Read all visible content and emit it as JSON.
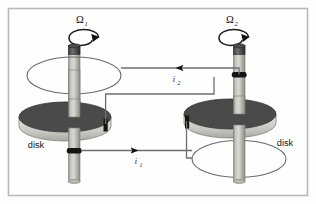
{
  "figure": {
    "border_color": "#b9b9b9",
    "background_color": "#fefefe"
  },
  "colors": {
    "disk_top": "#4a4a4a",
    "disk_rim": "#d4d4d0",
    "shaft_light": "#cfcfc9",
    "shaft_mid": "#a9a9a3",
    "shaft_dark": "#3a3a3a",
    "contact_ring": "#1c1c1c",
    "wire": "#6e6e6e",
    "loop_outline": "#6b6b6b",
    "arrow": "#111111",
    "text": "#1a1a1a"
  },
  "labels": {
    "omega_left": {
      "symbol": "Ω",
      "subscript": "1"
    },
    "omega_right": {
      "symbol": "Ω",
      "subscript": "2"
    },
    "current_lower": {
      "symbol": "i",
      "subscript": "1"
    },
    "current_upper": {
      "symbol": "i",
      "subscript": "2"
    },
    "disk_left": "disk",
    "disk_right": "disk"
  },
  "components": {
    "left_assembly": {
      "name": "left disk dynamo",
      "shaft_label": "vertical shaft",
      "loop_label": "upper coil loop",
      "disk_label": "disk",
      "spin_label": "Ω1"
    },
    "right_assembly": {
      "name": "right disk dynamo",
      "shaft_label": "vertical shaft",
      "loop_label": "lower coil loop",
      "disk_label": "disk",
      "spin_label": "Ω2"
    },
    "wires": [
      {
        "name": "upper wire",
        "current": "i2",
        "direction": "leftward",
        "from": "right shaft contact",
        "to": "left coil loop"
      },
      {
        "name": "lower wire",
        "current": "i1",
        "direction": "rightward",
        "from": "left shaft contact",
        "to": "right coil loop"
      }
    ]
  }
}
